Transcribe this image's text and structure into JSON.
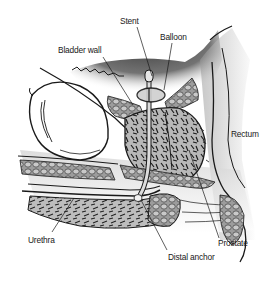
{
  "diagram": {
    "type": "anatomical-illustration",
    "view": "sagittal cross-section of male pelvis with prostatic stent",
    "labels": [
      {
        "id": "stent",
        "text": "Stent",
        "x": 120,
        "y": 15
      },
      {
        "id": "balloon",
        "text": "Balloon",
        "x": 160,
        "y": 31
      },
      {
        "id": "bladder_wall",
        "text": "Bladder wall",
        "x": 58,
        "y": 44
      },
      {
        "id": "rectum",
        "text": "Rectum",
        "x": 231,
        "y": 128
      },
      {
        "id": "urethra",
        "text": "Urethra",
        "x": 28,
        "y": 234
      },
      {
        "id": "prostate",
        "text": "Prostate",
        "x": 218,
        "y": 237
      },
      {
        "id": "distal_anchor",
        "text": "Distal anchor",
        "x": 168,
        "y": 251
      }
    ],
    "leader_lines": [
      {
        "from": "stent",
        "x1": 137,
        "y1": 27,
        "x2": 152,
        "y2": 76
      },
      {
        "from": "balloon",
        "x1": 172,
        "y1": 43,
        "x2": 164,
        "y2": 90
      },
      {
        "from": "bladder_wall",
        "x1": 103,
        "y1": 57,
        "x2": 133,
        "y2": 105
      },
      {
        "from": "urethra",
        "x1": 52,
        "y1": 232,
        "x2": 74,
        "y2": 198
      },
      {
        "from": "prostate",
        "x1": 219,
        "y1": 238,
        "x2": 189,
        "y2": 150
      },
      {
        "from": "distal_anchor",
        "x1": 167,
        "y1": 250,
        "x2": 141,
        "y2": 200
      }
    ],
    "colors": {
      "background": "#ffffff",
      "ink": "#1a1a1a",
      "tissue_shade": "#8a8a8a",
      "dark_shadow": "#3a3a3a",
      "light_tissue": "#d8d8d8"
    }
  }
}
